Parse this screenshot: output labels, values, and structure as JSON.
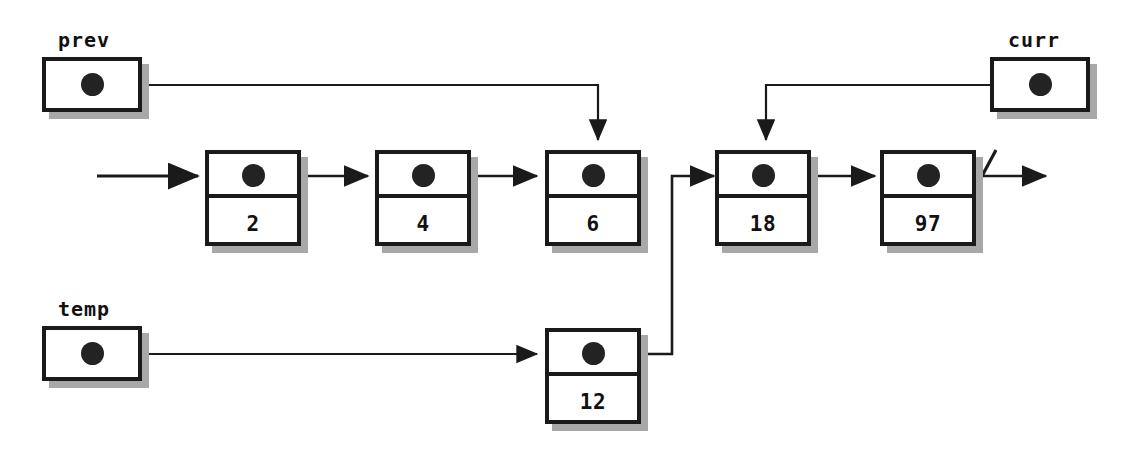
{
  "diagram": {
    "background_color": "#ffffff",
    "ink_color": "#1a1a1a",
    "shadow_color": "#a8a8a8",
    "dot_color": "#232323"
  },
  "pointers": [
    {
      "name": "prev",
      "label": "prev",
      "target_value": "6"
    },
    {
      "name": "curr",
      "label": "curr",
      "target_value": "18"
    },
    {
      "name": "temp",
      "label": "temp",
      "target_value": "12"
    }
  ],
  "nodes": [
    {
      "name": "node-2",
      "value": "2",
      "next": "4"
    },
    {
      "name": "node-4",
      "value": "4",
      "next": "6"
    },
    {
      "name": "node-6",
      "value": "6",
      "next": null
    },
    {
      "name": "node-18",
      "value": "18",
      "next": "97"
    },
    {
      "name": "node-97",
      "value": "97",
      "next": "null"
    },
    {
      "name": "node-12",
      "value": "12",
      "next": "18"
    }
  ],
  "markers": {
    "head_arrow": "head-entry-arrow",
    "null_terminator": "null-slash"
  }
}
